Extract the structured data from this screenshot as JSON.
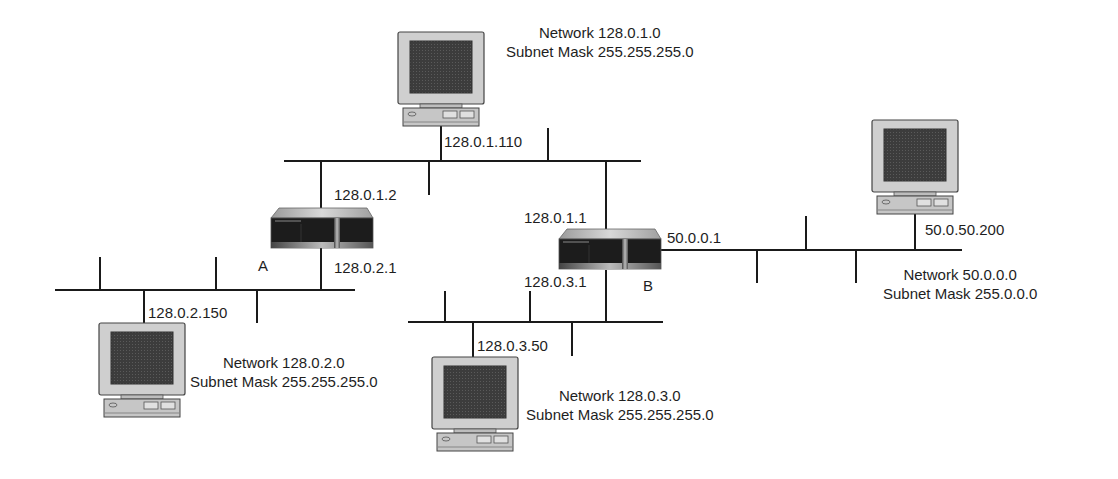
{
  "networks": [
    {
      "id": "net-128-0-1",
      "network_label": "Network 128.0.1.0",
      "mask_label": "Subnet Mask 255.255.255.0"
    },
    {
      "id": "net-128-0-2",
      "network_label": "Network 128.0.2.0",
      "mask_label": "Subnet Mask 255.255.255.0"
    },
    {
      "id": "net-128-0-3",
      "network_label": "Network 128.0.3.0",
      "mask_label": "Subnet Mask 255.255.255.0"
    },
    {
      "id": "net-50",
      "network_label": "Network 50.0.0.0",
      "mask_label": "Subnet Mask 255.0.0.0"
    }
  ],
  "hosts": [
    {
      "id": "host-top",
      "ip": "128.0.1.110"
    },
    {
      "id": "host-left",
      "ip": "128.0.2.150"
    },
    {
      "id": "host-bottom",
      "ip": "128.0.3.50"
    },
    {
      "id": "host-right",
      "ip": "50.0.50.200"
    }
  ],
  "routers": [
    {
      "id": "router-a",
      "name": "A",
      "interfaces": [
        "128.0.1.2",
        "128.0.2.1"
      ]
    },
    {
      "id": "router-b",
      "name": "B",
      "interfaces": [
        "128.0.1.1",
        "128.0.3.1",
        "50.0.0.1"
      ]
    }
  ],
  "colors": {
    "line": "#1a1a1a",
    "monitor_bezel": "#c8c8c8",
    "screen": "#3a3a3a",
    "router_body": "#1c1c1c",
    "router_top": "#b9b9b9"
  }
}
